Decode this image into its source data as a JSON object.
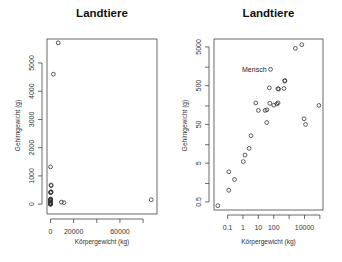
{
  "figure": {
    "panels": [
      {
        "title": "Landtiere",
        "xlabel": "Körpergewicht (kg)",
        "ylabel": "Gehirngewicht (g)"
      },
      {
        "title": "Landtiere",
        "xlabel": "Körpergewicht (kg)",
        "ylabel": "Gehirngewicht (g)",
        "annotation": "Mensch"
      }
    ]
  },
  "chart_data": [
    {
      "type": "scatter",
      "title": "Landtiere",
      "xlabel": "Körpergewicht (kg)",
      "ylabel": "Gehirngewicht (g)",
      "x_scale": "linear",
      "y_scale": "linear",
      "xticks": [
        0,
        20000,
        40000,
        60000,
        80000
      ],
      "xtick_labels": [
        "0",
        "20000",
        "",
        "60000",
        ""
      ],
      "yticks": [
        0,
        1000,
        2000,
        3000,
        4000,
        5000
      ],
      "ytick_labels": [
        "0",
        "1000",
        "2000",
        "3000",
        "4000",
        "5000"
      ],
      "xlim": [
        -3000,
        92000
      ],
      "ylim": [
        -350,
        5850
      ],
      "grid": false,
      "points": [
        {
          "x": 6654,
          "y": 5712
        },
        {
          "x": 2547,
          "y": 4603
        },
        {
          "x": 87000,
          "y": 154.5
        },
        {
          "x": 9400,
          "y": 70
        },
        {
          "x": 11700,
          "y": 50
        },
        {
          "x": 62,
          "y": 1320
        },
        {
          "x": 521,
          "y": 655
        },
        {
          "x": 529,
          "y": 680
        },
        {
          "x": 465,
          "y": 423
        },
        {
          "x": 521,
          "y": 440
        },
        {
          "x": 187,
          "y": 419
        },
        {
          "x": 207,
          "y": 406
        },
        {
          "x": 100,
          "y": 157
        },
        {
          "x": 192,
          "y": 180
        },
        {
          "x": 36,
          "y": 119.5
        },
        {
          "x": 160,
          "y": 169
        },
        {
          "x": 55.5,
          "y": 175
        },
        {
          "x": 35,
          "y": 56
        },
        {
          "x": 27.66,
          "y": 115
        },
        {
          "x": 10,
          "y": 115
        },
        {
          "x": 3.3,
          "y": 25.6
        },
        {
          "x": 1.35,
          "y": 8.1
        },
        {
          "x": 1.04,
          "y": 5.5
        },
        {
          "x": 0.12,
          "y": 1
        },
        {
          "x": 0.12,
          "y": 3
        },
        {
          "x": 0.28,
          "y": 1.9
        },
        {
          "x": 0.023,
          "y": 0.4
        },
        {
          "x": 2.5,
          "y": 12.1
        }
      ]
    },
    {
      "type": "scatter",
      "title": "Landtiere",
      "xlabel": "Körpergewicht (kg)",
      "ylabel": "Gehirngewicht (g)",
      "x_scale": "log",
      "y_scale": "log",
      "xticks": [
        0.1,
        1,
        10,
        100,
        1000,
        10000,
        100000
      ],
      "xtick_labels": [
        "0.1",
        "1",
        "10",
        "100",
        "",
        "10000",
        ""
      ],
      "yticks": [
        0.5,
        1.5,
        5,
        15,
        50,
        150,
        500,
        1500,
        5000
      ],
      "ytick_labels": [
        "0.5",
        "",
        "5",
        "",
        "50",
        "",
        "500",
        "",
        "5000"
      ],
      "xlim": [
        0.013,
        160000
      ],
      "ylim": [
        0.31,
        8000
      ],
      "grid": false,
      "annotations": [
        {
          "text": "Mensch",
          "x": 62,
          "y": 1320
        }
      ],
      "points": [
        {
          "x": 6654,
          "y": 5712
        },
        {
          "x": 2547,
          "y": 4603
        },
        {
          "x": 87000,
          "y": 154.5
        },
        {
          "x": 9400,
          "y": 70
        },
        {
          "x": 11700,
          "y": 50
        },
        {
          "x": 62,
          "y": 1320,
          "label": "Mensch"
        },
        {
          "x": 521,
          "y": 655
        },
        {
          "x": 529,
          "y": 680
        },
        {
          "x": 465,
          "y": 423
        },
        {
          "x": 207,
          "y": 406
        },
        {
          "x": 187,
          "y": 419
        },
        {
          "x": 100,
          "y": 157
        },
        {
          "x": 192,
          "y": 180
        },
        {
          "x": 160,
          "y": 169
        },
        {
          "x": 55.5,
          "y": 175
        },
        {
          "x": 36,
          "y": 119.5
        },
        {
          "x": 27.66,
          "y": 115
        },
        {
          "x": 35,
          "y": 56
        },
        {
          "x": 10,
          "y": 115
        },
        {
          "x": 6.8,
          "y": 179
        },
        {
          "x": 52,
          "y": 440
        },
        {
          "x": 3.3,
          "y": 25.6
        },
        {
          "x": 2.5,
          "y": 12.1
        },
        {
          "x": 1.35,
          "y": 8.1
        },
        {
          "x": 1.04,
          "y": 5.5
        },
        {
          "x": 0.28,
          "y": 1.9
        },
        {
          "x": 0.12,
          "y": 3
        },
        {
          "x": 0.12,
          "y": 1
        },
        {
          "x": 0.023,
          "y": 0.4
        }
      ]
    }
  ]
}
